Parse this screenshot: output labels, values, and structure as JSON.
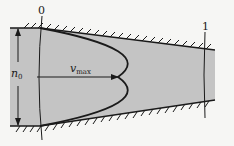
{
  "figure": {
    "type": "channel-flow-diagram",
    "colors": {
      "background": "#f6f6f4",
      "fluid_fill": "#c4c4c4",
      "ink": "#1a1a1a"
    }
  },
  "labels": {
    "section_0": "0",
    "section_1": "1",
    "width_label_base": "n",
    "width_label_sub": "0",
    "velocity_label_base": "v",
    "velocity_label_sub": "max"
  }
}
